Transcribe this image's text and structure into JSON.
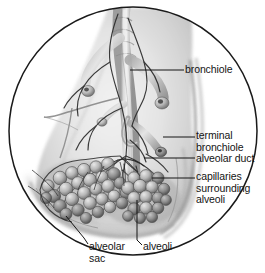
{
  "figure": {
    "shape": "circular-inset",
    "style": "grayscale pencil/airbrush medical illustration",
    "background_color": "#ffffff",
    "border_color": "#1a1a1a",
    "ink_color": "#141414"
  },
  "labels": {
    "bronchiole": "bronchiole",
    "terminal_bronchiole": "terminal\nbronchiole",
    "alveolar_duct": "alveolar duct",
    "capillaries": "capillaries\nsurrounding\nalveoli",
    "alveolar_sac": "alveolar\nsac",
    "alveoli": "alveoli"
  },
  "structures": [
    {
      "name": "bronchiole",
      "description": "large airway descending through center of lung tissue"
    },
    {
      "name": "terminal bronchiole",
      "description": "small branch ending at alveolar duct"
    },
    {
      "name": "alveolar duct",
      "description": "duct leading into alveolar sac"
    },
    {
      "name": "capillaries surrounding alveoli",
      "description": "vascular network over alveolar clusters"
    },
    {
      "name": "alveolar sac",
      "description": "grape-like cluster of alveoli"
    },
    {
      "name": "alveoli",
      "description": "individual air sacs"
    }
  ]
}
